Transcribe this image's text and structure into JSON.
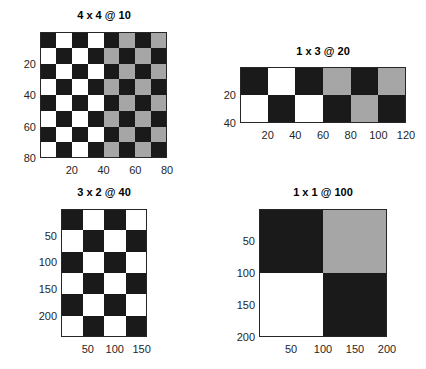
{
  "colors": {
    "black": "#1a1a1a",
    "white": "#ffffff",
    "gray": "#a6a6a6",
    "axis": "#262626"
  },
  "chart_data": [
    {
      "type": "heatmap",
      "title": "4 x 4 @ 10",
      "xlim": [
        0,
        80
      ],
      "ylim": [
        0,
        80
      ],
      "y_reversed": true,
      "xticks": [
        20,
        40,
        60,
        80
      ],
      "yticks": [
        20,
        40,
        60,
        80
      ],
      "rows": 8,
      "cols": 8,
      "grid": [
        [
          "B",
          "W",
          "B",
          "W",
          "B",
          "G",
          "B",
          "G"
        ],
        [
          "W",
          "B",
          "W",
          "B",
          "G",
          "B",
          "G",
          "B"
        ],
        [
          "B",
          "W",
          "B",
          "W",
          "B",
          "G",
          "B",
          "G"
        ],
        [
          "W",
          "B",
          "W",
          "B",
          "G",
          "B",
          "G",
          "B"
        ],
        [
          "B",
          "W",
          "B",
          "W",
          "B",
          "G",
          "B",
          "G"
        ],
        [
          "W",
          "B",
          "W",
          "B",
          "G",
          "B",
          "G",
          "B"
        ],
        [
          "B",
          "W",
          "B",
          "W",
          "B",
          "G",
          "B",
          "G"
        ],
        [
          "W",
          "B",
          "W",
          "B",
          "G",
          "B",
          "G",
          "B"
        ]
      ],
      "box": {
        "left": 40,
        "top": 32,
        "width": 127,
        "height": 126
      },
      "title_pos": {
        "x": 104,
        "y": 16
      }
    },
    {
      "type": "heatmap",
      "title": "1 x 3 @ 20",
      "xlim": [
        0,
        120
      ],
      "ylim": [
        0,
        40
      ],
      "y_reversed": true,
      "xticks": [
        20,
        40,
        60,
        80,
        100,
        120
      ],
      "yticks": [
        20,
        40
      ],
      "rows": 2,
      "cols": 6,
      "grid": [
        [
          "B",
          "W",
          "B",
          "G",
          "B",
          "G"
        ],
        [
          "W",
          "B",
          "W",
          "B",
          "G",
          "B"
        ]
      ],
      "box": {
        "left": 240,
        "top": 67,
        "width": 166,
        "height": 56
      },
      "title_pos": {
        "x": 323,
        "y": 52
      }
    },
    {
      "type": "heatmap",
      "title": "3 x 2 @ 40",
      "xlim": [
        0,
        160
      ],
      "ylim": [
        0,
        240
      ],
      "y_reversed": true,
      "xticks": [
        50,
        100,
        150
      ],
      "yticks": [
        50,
        100,
        150,
        200
      ],
      "rows": 6,
      "cols": 4,
      "grid": [
        [
          "B",
          "W",
          "B",
          "W"
        ],
        [
          "W",
          "B",
          "W",
          "B"
        ],
        [
          "B",
          "W",
          "B",
          "W"
        ],
        [
          "W",
          "B",
          "W",
          "B"
        ],
        [
          "B",
          "W",
          "B",
          "W"
        ],
        [
          "W",
          "B",
          "W",
          "B"
        ]
      ],
      "box": {
        "left": 61,
        "top": 209,
        "width": 86,
        "height": 128
      },
      "title_pos": {
        "x": 104,
        "y": 193
      }
    },
    {
      "type": "heatmap",
      "title": "1 x 1 @ 100",
      "xlim": [
        0,
        200
      ],
      "ylim": [
        0,
        200
      ],
      "y_reversed": true,
      "xticks": [
        50,
        100,
        150,
        200
      ],
      "yticks": [
        50,
        100,
        150,
        200
      ],
      "rows": 2,
      "cols": 2,
      "grid": [
        [
          "B",
          "G"
        ],
        [
          "W",
          "B"
        ]
      ],
      "box": {
        "left": 259,
        "top": 209,
        "width": 128,
        "height": 128
      },
      "title_pos": {
        "x": 323,
        "y": 193
      }
    }
  ]
}
